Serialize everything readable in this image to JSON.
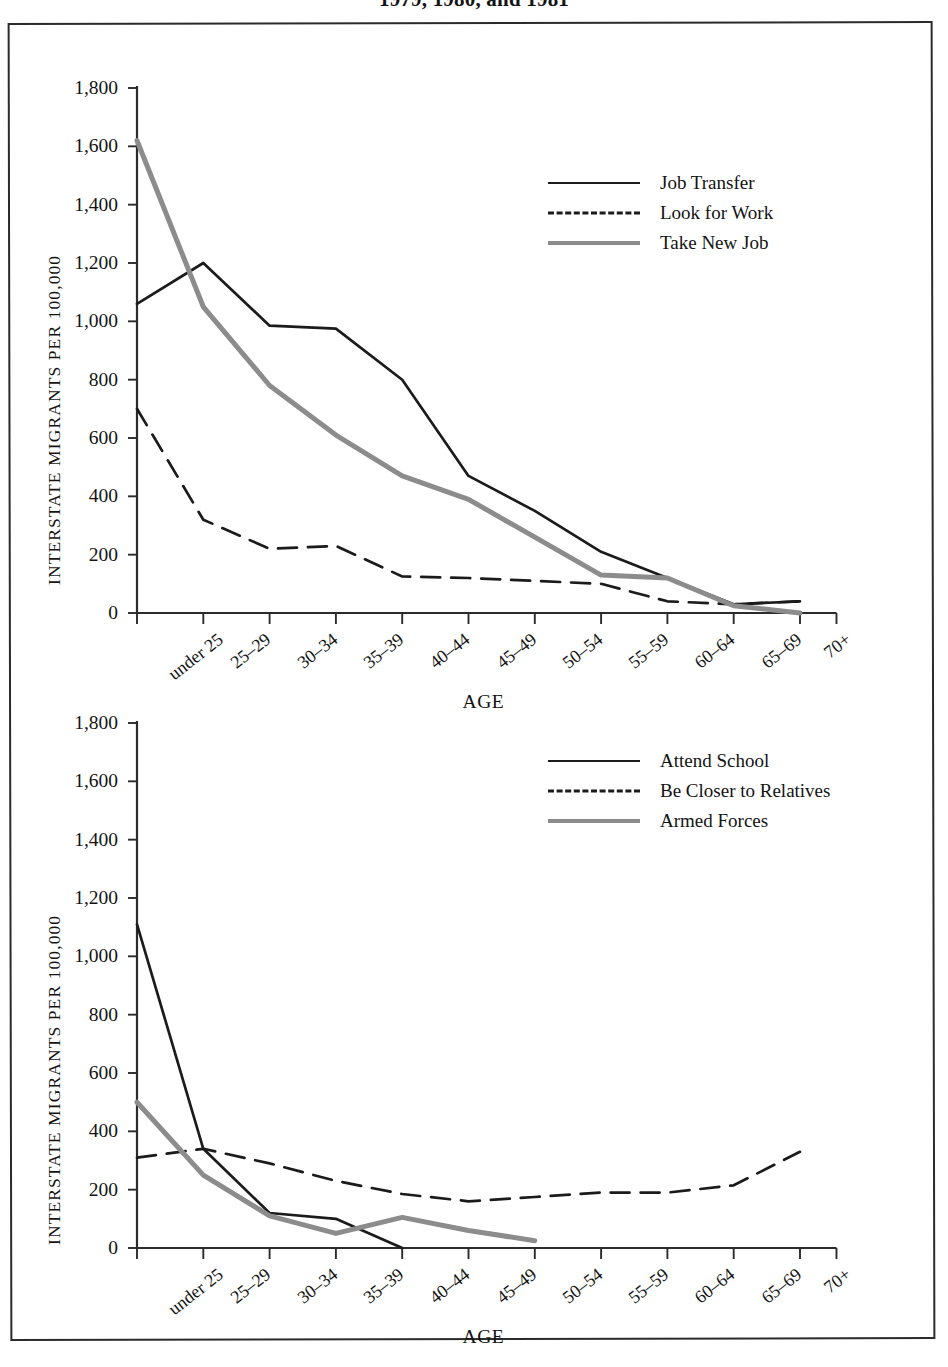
{
  "page": {
    "title": "1979, 1980, and 1981"
  },
  "axis": {
    "ylabel": "INTERSTATE MIGRANTS PER 100,000",
    "xlabel": "AGE",
    "yticks": [
      "0",
      "200",
      "400",
      "600",
      "800",
      "1,000",
      "1,200",
      "1,400",
      "1,600",
      "1,800"
    ],
    "categories": [
      "under 25",
      "25–29",
      "30–34",
      "35–39",
      "40–44",
      "45–49",
      "50–54",
      "55–59",
      "60–64",
      "65–69",
      "70+"
    ]
  },
  "colors": {
    "solid_black": "#1b1b1b",
    "dashed_black": "#1b1b1b",
    "solid_gray": "#8c8c8c",
    "axis": "#2b2b2b",
    "frame": "#2b2b2b"
  },
  "legend1": [
    {
      "label": "Job Transfer",
      "style": "solid-black"
    },
    {
      "label": "Look for Work",
      "style": "dashed-black"
    },
    {
      "label": "Take New Job",
      "style": "solid-gray"
    }
  ],
  "legend2": [
    {
      "label": "Attend School",
      "style": "solid-black"
    },
    {
      "label": "Be Closer to Relatives",
      "style": "dashed-black"
    },
    {
      "label": "Armed Forces",
      "style": "solid-gray"
    }
  ],
  "chart_data": [
    {
      "type": "line",
      "title": "Reason for interstate migration: work-related reasons",
      "xlabel": "AGE",
      "ylabel": "INTERSTATE MIGRANTS PER 100,000",
      "categories": [
        "under 25",
        "25–29",
        "30–34",
        "35–39",
        "40–44",
        "45–49",
        "50–54",
        "55–59",
        "60–64",
        "65–69",
        "70+"
      ],
      "ylim": [
        0,
        1800
      ],
      "yticks": [
        0,
        200,
        400,
        600,
        800,
        1000,
        1200,
        1400,
        1600,
        1800
      ],
      "grid": false,
      "legend_position": "top-right",
      "series": [
        {
          "name": "Job Transfer",
          "style": "solid",
          "color": "#1b1b1b",
          "values": [
            1060,
            1200,
            985,
            975,
            800,
            470,
            350,
            210,
            120,
            30,
            40
          ]
        },
        {
          "name": "Look for Work",
          "style": "dashed",
          "color": "#1b1b1b",
          "values": [
            700,
            320,
            220,
            230,
            125,
            120,
            110,
            100,
            40,
            30,
            40
          ]
        },
        {
          "name": "Take New Job",
          "style": "solid",
          "color": "#8c8c8c",
          "values": [
            1620,
            1050,
            780,
            610,
            470,
            390,
            260,
            130,
            120,
            25,
            0
          ]
        }
      ]
    },
    {
      "type": "line",
      "title": "Reason for interstate migration: non-work reasons",
      "xlabel": "AGE",
      "ylabel": "INTERSTATE MIGRANTS PER 100,000",
      "categories": [
        "under 25",
        "25–29",
        "30–34",
        "35–39",
        "40–44",
        "45–49",
        "50–54",
        "55–59",
        "60–64",
        "65–69",
        "70+"
      ],
      "ylim": [
        0,
        1800
      ],
      "yticks": [
        0,
        200,
        400,
        600,
        800,
        1000,
        1200,
        1400,
        1600,
        1800
      ],
      "grid": false,
      "legend_position": "top-right",
      "series": [
        {
          "name": "Attend School",
          "style": "solid",
          "color": "#1b1b1b",
          "values": [
            1110,
            340,
            120,
            100,
            0,
            null,
            null,
            null,
            null,
            null,
            null
          ]
        },
        {
          "name": "Be Closer to Relatives",
          "style": "dashed",
          "color": "#1b1b1b",
          "values": [
            310,
            340,
            290,
            230,
            185,
            160,
            175,
            190,
            190,
            215,
            330
          ]
        },
        {
          "name": "Armed Forces",
          "style": "solid",
          "color": "#8c8c8c",
          "values": [
            500,
            250,
            110,
            50,
            105,
            60,
            25,
            null,
            null,
            null,
            null
          ]
        }
      ]
    }
  ]
}
